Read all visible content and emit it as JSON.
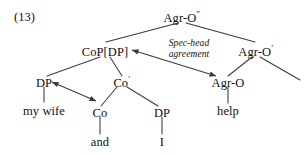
{
  "figure": {
    "example_number": "(13)",
    "kind": "syntax-tree",
    "line_color": "#3a3a42",
    "text_color": "#111111",
    "background": "#ffffff"
  },
  "nodes": {
    "root": {
      "label": "Agr-O",
      "prime": "″"
    },
    "cop": {
      "label": "CoP[DP]",
      "prime": ""
    },
    "agr_o_bar": {
      "label": "Agr-O",
      "prime": "′"
    },
    "dp_spec": {
      "label": "DP",
      "prime": ""
    },
    "co_bar": {
      "label": "Co",
      "prime": "′"
    },
    "agr_o_head": {
      "label": "Agr-O",
      "prime": ""
    },
    "co_head": {
      "label": "Co",
      "prime": ""
    },
    "dp_comp": {
      "label": "DP",
      "prime": ""
    }
  },
  "terminals": {
    "my_wife": "my wife",
    "and": "and",
    "i": "I",
    "help": "help"
  },
  "annotations": {
    "spec_head": {
      "line1": "Spec-head",
      "line2": "agreement"
    }
  }
}
